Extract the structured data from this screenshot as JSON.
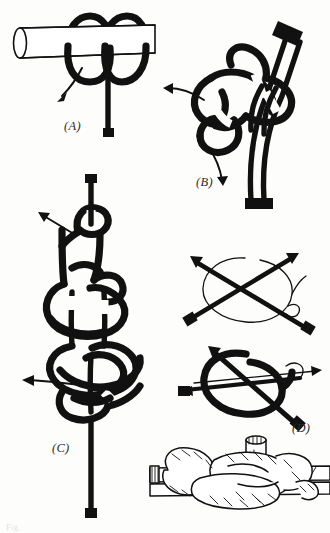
{
  "page": {
    "kind": "illustration-plate",
    "background_color": "#fdfdfc",
    "ink_color": "#111111",
    "width": 330,
    "height": 533,
    "bottom_edge_artifact": "Fig."
  },
  "figures": [
    {
      "id": "A",
      "label": "(A)",
      "label_x": 64,
      "label_y": 130,
      "description": "Two turns of cord taken around a horizontal spar; working end passes down and a curved arrow shows the direction of the tuck.",
      "elements": [
        "spar",
        "first-turn",
        "second-turn",
        "standing-part",
        "direction-arrow",
        "cord-end-cap"
      ]
    },
    {
      "id": "B",
      "label": "(B)",
      "label_x": 196,
      "label_y": 186,
      "description": "The turns are slid off the spar and rotated; two arrows show the loops being opened in opposite directions while the doubled standing parts hang down to a whipped end.",
      "elements": [
        "doubled-standing-part",
        "upper-end-cap",
        "lower-end-cap",
        "loop-left",
        "loop-right",
        "arrow-left",
        "arrow-down"
      ]
    },
    {
      "id": "C",
      "label": "(C)",
      "label_x": 52,
      "label_y": 452,
      "description": "The completed multi-turn binding knot shown drawn up vertically on a single line, with two arrows indicating the ends being hauled taut.",
      "elements": [
        "vertical-core-line",
        "top-end-cap",
        "bottom-end-cap",
        "upper-coil",
        "middle-coil",
        "lower-coil",
        "arrow-upper-left",
        "arrow-lower-left"
      ]
    },
    {
      "id": "D",
      "label": "(D)",
      "label_x": 292,
      "label_y": 432,
      "description": "Two stages shown as schematic crossed rods: first a light cord is carried around the crossing, then the crossing is bound and the ends pulled out along the arrows.",
      "elements": [
        "stage-one-crossed-rods",
        "stage-one-light-loop",
        "stage-two-crossed-rods",
        "stage-two-heavy-loop",
        "pull-arrows"
      ]
    },
    {
      "id": "E",
      "label": "",
      "label_x": 0,
      "label_y": 0,
      "description": "Realistic line-drawn rendering: the finished lashing of a vertical spar to a horizontal rail, drawn with outlined laid rope and hatched shading.",
      "elements": [
        "horizontal-rail",
        "vertical-post",
        "outlined-rope-turns",
        "rope-hatching",
        "cut-rope-end"
      ]
    }
  ]
}
